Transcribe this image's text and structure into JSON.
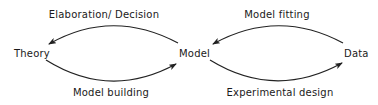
{
  "nodes": {
    "theory": "Theory",
    "model": "Model",
    "data": "Data"
  },
  "edges": {
    "elaboration_decision": {
      "label": "Elaboration/ Decision",
      "from": "Model",
      "to": "Theory"
    },
    "model_building": {
      "label": "Model building",
      "from": "Theory",
      "to": "Model"
    },
    "model_fitting": {
      "label": "Model fitting",
      "from": "Data",
      "to": "Model"
    },
    "experimental_design": {
      "label": "Experimental design",
      "from": "Model",
      "to": "Data"
    }
  },
  "colors": {
    "stroke": "#222222",
    "text": "#1a1a1a",
    "background": "#ffffff"
  }
}
